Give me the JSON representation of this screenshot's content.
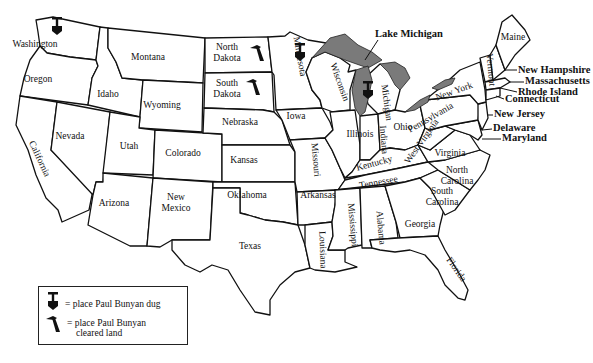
{
  "map": {
    "title": "United States map of Paul Bunyan locations",
    "states": [
      {
        "name": "Washington",
        "x": 35,
        "y": 47
      },
      {
        "name": "Oregon",
        "x": 38,
        "y": 82
      },
      {
        "name": "California",
        "x": 37,
        "y": 160,
        "rotate": 65
      },
      {
        "name": "Nevada",
        "x": 70,
        "y": 139
      },
      {
        "name": "Idaho",
        "x": 108,
        "y": 97
      },
      {
        "name": "Montana",
        "x": 148,
        "y": 60
      },
      {
        "name": "Wyoming",
        "x": 162,
        "y": 108
      },
      {
        "name": "Utah",
        "x": 129,
        "y": 149
      },
      {
        "name": "Colorado",
        "x": 183,
        "y": 156
      },
      {
        "name": "Arizona",
        "x": 114,
        "y": 206
      },
      {
        "name": "New",
        "x": 176,
        "y": 200
      },
      {
        "name": "Mexico",
        "x": 176,
        "y": 211
      },
      {
        "name": "North",
        "x": 227,
        "y": 50
      },
      {
        "name": "Dakota",
        "x": 227,
        "y": 61
      },
      {
        "name": "South",
        "x": 227,
        "y": 86
      },
      {
        "name": "Dakota",
        "x": 227,
        "y": 97
      },
      {
        "name": "Nebraska",
        "x": 240,
        "y": 125
      },
      {
        "name": "Kansas",
        "x": 244,
        "y": 163
      },
      {
        "name": "Oklahoma",
        "x": 247,
        "y": 198
      },
      {
        "name": "Texas",
        "x": 250,
        "y": 249
      },
      {
        "name": "Minnesota",
        "x": 297,
        "y": 57,
        "rotate": 80
      },
      {
        "name": "Iowa",
        "x": 296,
        "y": 119
      },
      {
        "name": "Missouri",
        "x": 313,
        "y": 160,
        "rotate": 85
      },
      {
        "name": "Arkansas",
        "x": 318,
        "y": 198
      },
      {
        "name": "Louisiana",
        "x": 320,
        "y": 250,
        "rotate": 88
      },
      {
        "name": "Wisconsin",
        "x": 337,
        "y": 83,
        "rotate": 70
      },
      {
        "name": "Illinois",
        "x": 360,
        "y": 137
      },
      {
        "name": "Michigan",
        "x": 384,
        "y": 103,
        "rotate": 82
      },
      {
        "name": "Indiana",
        "x": 381,
        "y": 140,
        "rotate": 85
      },
      {
        "name": "Ohio",
        "x": 403,
        "y": 130
      },
      {
        "name": "Kentucky",
        "x": 375,
        "y": 166,
        "rotate": -15
      },
      {
        "name": "Tennessee",
        "x": 379,
        "y": 185,
        "rotate": -10
      },
      {
        "name": "Mississippi",
        "x": 350,
        "y": 225,
        "rotate": 85
      },
      {
        "name": "Alabama",
        "x": 378,
        "y": 228,
        "rotate": 85
      },
      {
        "name": "Georgia",
        "x": 420,
        "y": 227
      },
      {
        "name": "Florida",
        "x": 454,
        "y": 271,
        "rotate": 55
      },
      {
        "name": "South",
        "x": 442,
        "y": 194
      },
      {
        "name": "Carolina",
        "x": 442,
        "y": 205
      },
      {
        "name": "North",
        "x": 457,
        "y": 173
      },
      {
        "name": "Carolina",
        "x": 457,
        "y": 184
      },
      {
        "name": "Virginia",
        "x": 450,
        "y": 156
      },
      {
        "name": "West Virginia",
        "x": 424,
        "y": 143,
        "rotate": -55
      },
      {
        "name": "Pennsylvania",
        "x": 432,
        "y": 120,
        "rotate": -30
      },
      {
        "name": "New York",
        "x": 455,
        "y": 94,
        "rotate": -20
      },
      {
        "name": "Vermont",
        "x": 488,
        "y": 70,
        "rotate": 85
      },
      {
        "name": "Maine",
        "x": 513,
        "y": 40
      }
    ],
    "external_labels": [
      {
        "name": "Lake Michigan",
        "x": 375,
        "y": 37
      },
      {
        "name": "New Hampshire",
        "x": 518,
        "y": 73
      },
      {
        "name": "Massachusetts",
        "x": 525,
        "y": 84
      },
      {
        "name": "Rhode Island",
        "x": 518,
        "y": 95
      },
      {
        "name": "Connecticut",
        "x": 505,
        "y": 102
      },
      {
        "name": "New Jersey",
        "x": 494,
        "y": 117
      },
      {
        "name": "Delaware",
        "x": 493,
        "y": 131
      },
      {
        "name": "Maryland",
        "x": 502,
        "y": 141
      }
    ],
    "markers": [
      {
        "type": "dug",
        "state": "Washington",
        "x": 57,
        "y": 25
      },
      {
        "type": "dug",
        "state": "Minnesota",
        "x": 300,
        "y": 51
      },
      {
        "type": "dug",
        "state": "Michigan",
        "x": 368,
        "y": 89
      },
      {
        "type": "cleared",
        "state": "North Dakota",
        "x": 257,
        "y": 52
      },
      {
        "type": "cleared",
        "state": "South Dakota",
        "x": 253,
        "y": 86
      }
    ]
  },
  "legend": {
    "dug_label": "= place Paul Bunyan dug",
    "cleared_label_line1": "= place Paul Bunyan",
    "cleared_label_line2": "cleared land"
  },
  "colors": {
    "lake_fill": "#7a7a7a",
    "border": "#111111",
    "background": "#ffffff"
  }
}
